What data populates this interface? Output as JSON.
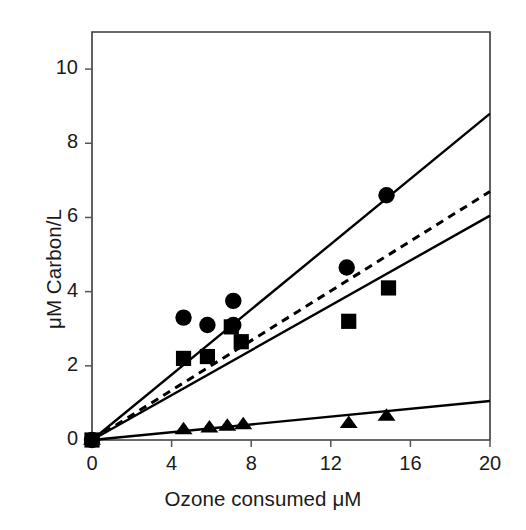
{
  "chart_data": {
    "type": "scatter",
    "title": "",
    "xlabel": "Ozone consumed μM",
    "ylabel": "μM Carbon/L",
    "xlim": [
      0,
      20
    ],
    "ylim": [
      0,
      11
    ],
    "xticks": [
      0,
      4,
      8,
      12,
      16,
      20
    ],
    "yticks": [
      0,
      2,
      4,
      6,
      8,
      10
    ],
    "xtick_labels": [
      "0",
      "4",
      "8",
      "12",
      "16",
      "20"
    ],
    "ytick_labels": [
      "0",
      "2",
      "4",
      "6",
      "8",
      "10"
    ],
    "grid": false,
    "legend": "none",
    "frame": "box",
    "series": [
      {
        "name": "circles",
        "marker": "circle",
        "color": "#000000",
        "points": [
          {
            "x": 0.0,
            "y": 0.0
          },
          {
            "x": 4.6,
            "y": 3.3
          },
          {
            "x": 5.8,
            "y": 3.1
          },
          {
            "x": 7.1,
            "y": 3.75
          },
          {
            "x": 7.1,
            "y": 3.1
          },
          {
            "x": 12.8,
            "y": 4.65
          },
          {
            "x": 14.8,
            "y": 6.6
          }
        ]
      },
      {
        "name": "squares",
        "marker": "square",
        "color": "#000000",
        "points": [
          {
            "x": 0.0,
            "y": 0.0
          },
          {
            "x": 4.6,
            "y": 2.2
          },
          {
            "x": 5.8,
            "y": 2.25
          },
          {
            "x": 7.0,
            "y": 3.05
          },
          {
            "x": 7.5,
            "y": 2.65
          },
          {
            "x": 12.9,
            "y": 3.2
          },
          {
            "x": 14.9,
            "y": 4.1
          }
        ]
      },
      {
        "name": "triangles",
        "marker": "triangle",
        "color": "#000000",
        "points": [
          {
            "x": 0.0,
            "y": 0.0
          },
          {
            "x": 4.6,
            "y": 0.28
          },
          {
            "x": 5.9,
            "y": 0.33
          },
          {
            "x": 6.8,
            "y": 0.38
          },
          {
            "x": 7.6,
            "y": 0.42
          },
          {
            "x": 12.9,
            "y": 0.45
          },
          {
            "x": 14.8,
            "y": 0.65
          }
        ]
      }
    ],
    "lines": [
      {
        "name": "circle-fit-line",
        "style": "solid",
        "color": "#000000",
        "x0": 0.0,
        "y0": 0.0,
        "x1": 20.0,
        "y1": 8.8
      },
      {
        "name": "dashed-fit-line",
        "style": "dashed",
        "color": "#000000",
        "x0": 0.0,
        "y0": 0.0,
        "x1": 20.0,
        "y1": 6.7
      },
      {
        "name": "square-fit-line",
        "style": "solid",
        "color": "#000000",
        "x0": 0.0,
        "y0": 0.0,
        "x1": 20.0,
        "y1": 6.05
      },
      {
        "name": "triangle-fit-line",
        "style": "solid",
        "color": "#000000",
        "x0": 0.0,
        "y0": 0.0,
        "x1": 20.0,
        "y1": 1.05
      }
    ]
  },
  "axes": {
    "x_label": "Ozone consumed μM",
    "y_label": "μM Carbon/L"
  },
  "ticks": {
    "x": [
      "0",
      "4",
      "8",
      "12",
      "16",
      "20"
    ],
    "y": [
      "0",
      "2",
      "4",
      "6",
      "8",
      "10"
    ]
  }
}
